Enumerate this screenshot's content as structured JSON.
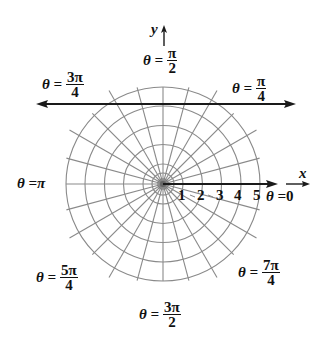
{
  "diagram": {
    "type": "polar-grid",
    "center": {
      "x": 163,
      "y": 184
    },
    "ring_spacing_px": 19.4,
    "rings": [
      1,
      2,
      3,
      4,
      5
    ],
    "spoke_step_degrees": 15,
    "axis_labels": {
      "x": "x",
      "y": "y"
    },
    "radial_ticks": [
      "1",
      "2",
      "3",
      "4",
      "5"
    ],
    "angle_labels": [
      {
        "id": "0",
        "prefix": "θ = ",
        "value": "0"
      },
      {
        "id": "pi_over_4",
        "prefix": "θ = ",
        "num": "π",
        "den": "4"
      },
      {
        "id": "pi_over_2",
        "prefix": "θ = ",
        "num": "π",
        "den": "2"
      },
      {
        "id": "3pi_over_4",
        "prefix": "θ = ",
        "num": "3π",
        "den": "4"
      },
      {
        "id": "pi",
        "prefix": "θ = ",
        "value": "π"
      },
      {
        "id": "5pi_over_4",
        "prefix": "θ = ",
        "num": "5π",
        "den": "4"
      },
      {
        "id": "3pi_over_2",
        "prefix": "θ = ",
        "num": "3π",
        "den": "2"
      },
      {
        "id": "7pi_over_4",
        "prefix": "θ = ",
        "num": "7π",
        "den": "4"
      }
    ],
    "colors": {
      "grid": "#8a8a8a",
      "axis": "#1a1a1a",
      "text": "#111111"
    }
  }
}
